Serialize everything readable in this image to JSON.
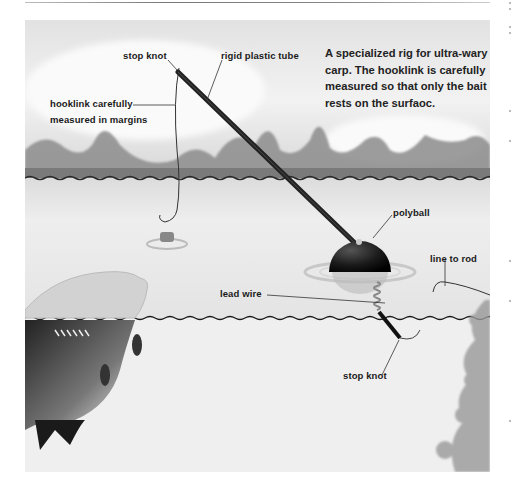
{
  "figure": {
    "caption": "A specialized rig for ultra-wary carp. The hooklink is carefully measured so that only the bait rests on the surfaoc.",
    "labels": {
      "stop_knot_top": "stop knot",
      "rigid_plastic_tube": "rigid plastic tube",
      "hooklink_line1": "hooklink carefully",
      "hooklink_line2": "measured in margins",
      "polyball": "polyball",
      "line_to_rod": "line to rod",
      "lead_wire": "lead wire",
      "stop_knot_bottom": "stop knot"
    },
    "elements": {
      "sky": "sky-background",
      "treeline": "treeline-silhouette",
      "water_surface": "water-surface",
      "underwater": "underwater-region",
      "tube": "rigid-plastic-tube",
      "ball": "polyball-float",
      "hook": "hook-with-bait",
      "fish": "carp",
      "weed": "water-weed"
    },
    "colors": {
      "sky_top": "#e6e6e6",
      "sky_mid": "#f4f4f4",
      "tree": "#8a8a8a",
      "waterline": "#2a2a2a",
      "surface": "#e9e9e9",
      "underwater": "#f1f1f1",
      "tube": "#222222",
      "ball": "#1c1c1c",
      "weed": "#9a9a9a"
    }
  }
}
